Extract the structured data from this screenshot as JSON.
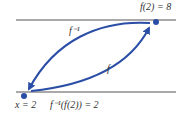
{
  "diagram": {
    "colors": {
      "arrow": "#2a4ea6",
      "line": "#555555",
      "text": "#333333"
    },
    "labels": {
      "top_point": "f(2) = 8",
      "bottom_point": "x = 2",
      "composition": "f⁻¹(f(2)) = 2",
      "inverse_arrow": "f⁻¹",
      "forward_arrow": "f"
    },
    "points": [
      {
        "name": "x",
        "value": "2"
      },
      {
        "name": "f(2)",
        "value": "8"
      }
    ]
  }
}
